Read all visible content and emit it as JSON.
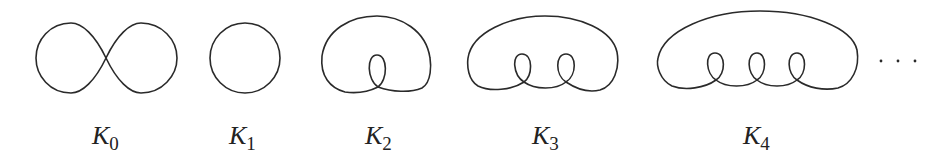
{
  "figure": {
    "knots": [
      {
        "name": "K",
        "sub": "0",
        "shape": "figure-eight (two tangent loops)"
      },
      {
        "name": "K",
        "sub": "1",
        "shape": "circle"
      },
      {
        "name": "K",
        "sub": "2",
        "shape": "outer loop with 1 kink"
      },
      {
        "name": "K",
        "sub": "3",
        "shape": "outer loop with 2 kinks"
      },
      {
        "name": "K",
        "sub": "4",
        "shape": "outer loop with 3 kinks"
      }
    ],
    "ellipsis": "· · ·",
    "stroke_color": "#2a2a2a"
  }
}
